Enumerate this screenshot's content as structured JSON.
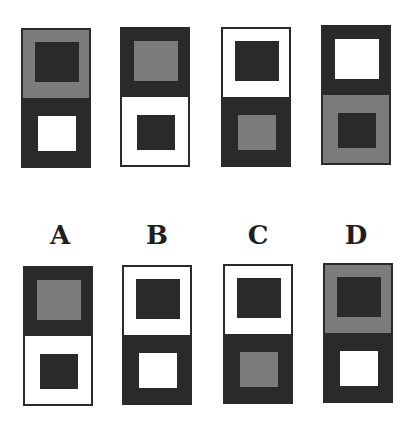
{
  "colors": {
    "dark": "#2a2a2a",
    "gray": "#7b7b7b",
    "white": "#ffffff"
  },
  "top_row": [
    {
      "x": 21,
      "y": 28,
      "top": {
        "surround": "gray",
        "center": "dark"
      },
      "bottom": {
        "surround": "dark",
        "center": "white"
      }
    },
    {
      "x": 120,
      "y": 27,
      "top": {
        "surround": "dark",
        "center": "gray"
      },
      "bottom": {
        "surround": "white",
        "center": "dark"
      }
    },
    {
      "x": 221,
      "y": 27,
      "top": {
        "surround": "white",
        "center": "dark"
      },
      "bottom": {
        "surround": "dark",
        "center": "gray"
      }
    },
    {
      "x": 321,
      "y": 25,
      "top": {
        "surround": "dark",
        "center": "white"
      },
      "bottom": {
        "surround": "gray",
        "center": "dark"
      }
    }
  ],
  "options": [
    {
      "label": "A",
      "label_x": 40,
      "x": 23,
      "y": 266,
      "top": {
        "surround": "dark",
        "center": "gray"
      },
      "bottom": {
        "surround": "white",
        "center": "dark"
      }
    },
    {
      "label": "B",
      "label_x": 137,
      "x": 122,
      "y": 265,
      "top": {
        "surround": "white",
        "center": "dark"
      },
      "bottom": {
        "surround": "dark",
        "center": "white"
      }
    },
    {
      "label": "C",
      "label_x": 238,
      "x": 223,
      "y": 264,
      "top": {
        "surround": "white",
        "center": "dark"
      },
      "bottom": {
        "surround": "dark",
        "center": "gray"
      }
    },
    {
      "label": "D",
      "label_x": 336,
      "x": 323,
      "y": 263,
      "top": {
        "surround": "gray",
        "center": "dark"
      },
      "bottom": {
        "surround": "dark",
        "center": "white"
      }
    }
  ]
}
